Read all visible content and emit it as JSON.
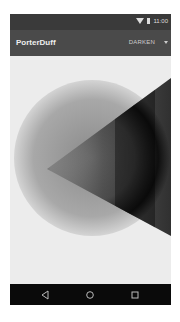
{
  "status_bar": {
    "time": "11:00",
    "icons": [
      "wifi-icon",
      "battery-icon"
    ]
  },
  "toolbar": {
    "title": "PorterDuff",
    "mode_selected": "DARKEN",
    "dropdown_icon": "chevron-down-icon"
  },
  "canvas": {
    "description": "Radial-gradient circle composited with a horizontal-gradient triangle using DARKEN mode",
    "circle_colors": [
      "#8a8a8a",
      "#dcdcdc"
    ],
    "triangle_colors": [
      "#9a9a9a",
      "#000000",
      "#3c3c3c"
    ]
  },
  "nav_bar": {
    "back": "back-icon",
    "home": "home-icon",
    "recents": "recents-icon"
  }
}
